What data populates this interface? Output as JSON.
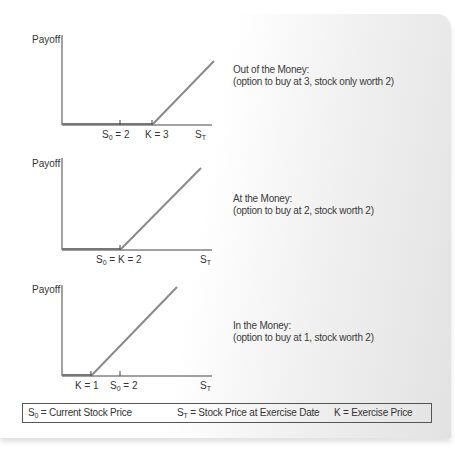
{
  "panels": [
    {
      "id": "out-of-the-money",
      "y_label": "Payoff",
      "x_label": "S",
      "x_label_sub": "T",
      "tick_labels": [
        {
          "text": "S",
          "sub": "0",
          "rest": " = 2"
        },
        {
          "text": "K = 3"
        }
      ],
      "caption_title": "Out of the Money:",
      "caption_detail": "(option to buy at 3, stock only worth 2)"
    },
    {
      "id": "at-the-money",
      "y_label": "Payoff",
      "x_label": "S",
      "x_label_sub": "T",
      "tick_labels": [
        {
          "text": "S",
          "sub": "0",
          "rest": " = K = 2"
        }
      ],
      "caption_title": "At the Money:",
      "caption_detail": "(option to buy at 2, stock worth 2)"
    },
    {
      "id": "in-the-money",
      "y_label": "Payoff",
      "x_label": "S",
      "x_label_sub": "T",
      "tick_labels": [
        {
          "text": "K = 1"
        },
        {
          "text": "S",
          "sub": "0",
          "rest": " = 2"
        }
      ],
      "caption_title": "In the Money:",
      "caption_detail": "(option to buy at 1, stock worth 2)"
    }
  ],
  "legend": {
    "s0": {
      "sym": "S",
      "sub": "0",
      "desc": " = Current Stock Price"
    },
    "st": {
      "sym": "S",
      "sub": "T",
      "desc": " = Stock Price at Exercise Date"
    },
    "k": {
      "sym": "K",
      "desc": " = Exercise Price"
    }
  },
  "colors": {
    "axis": "#444444",
    "payoff_line": "#8a8a8a",
    "text": "#333333"
  }
}
